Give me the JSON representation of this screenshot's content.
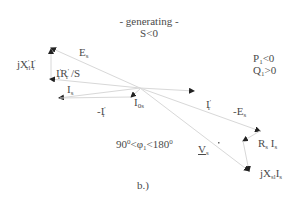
{
  "header": {
    "mode": "- generating -",
    "slip": "S<0"
  },
  "conditions": {
    "p": "P",
    "p_sub": "1",
    "p_rel": "<0",
    "q": "Q",
    "q_sub": "1",
    "q_rel": ">0"
  },
  "angle": {
    "left": "90",
    "deg1": "0",
    "mid": "<φ",
    "phi_sub": "1",
    "right": "<180",
    "deg2": "0"
  },
  "caption": "b.)",
  "labels": {
    "Es": {
      "main": "E",
      "sub": "s"
    },
    "jXrIr": {
      "main": "jX",
      "sup": "'",
      "sub": "rl",
      "tail": "I",
      "tail_sup": "'",
      "tail_sub": "r"
    },
    "IrRrS": {
      "main": "I",
      "sup": "'",
      "sub": "r",
      "mid": "R",
      "mid_sup": "'",
      "mid_sub": "r",
      "tail": " /S"
    },
    "Is": {
      "main": "I",
      "sub": "s"
    },
    "negIr": {
      "main": "-I",
      "sup": "'",
      "sub": "r"
    },
    "I0s": {
      "main": "I",
      "sub": "0s"
    },
    "Ir": {
      "main": "I",
      "sup": "'",
      "sub": "r"
    },
    "negEs": {
      "main": "-E",
      "sub": "s"
    },
    "RsIs": {
      "main": "R",
      "sub": "s",
      "tail": " I",
      "tail_sub": "s"
    },
    "Vs": {
      "main": "V",
      "sub": "s"
    },
    "jXsIs": {
      "main": "jX",
      "sub": "sl",
      "tail": "I",
      "tail_sub": "s"
    }
  },
  "colors": {
    "line": "#d8d8d8",
    "arrow": "#222222",
    "text": "#4a4a4a"
  }
}
